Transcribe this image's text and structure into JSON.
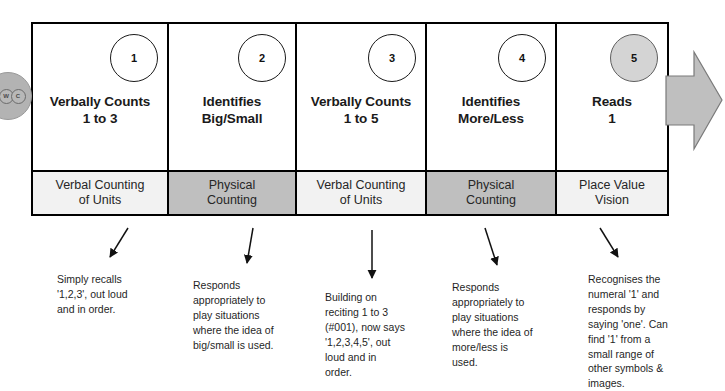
{
  "watermark": {
    "name": "watermark-badge",
    "letters": [
      "W",
      "C"
    ]
  },
  "progression_arrow": {
    "name": "progression-arrow",
    "color": "#bfbfbf"
  },
  "colors": {
    "light_strand": "#f2f2f2",
    "dark_strand": "#bfbfbf",
    "border": "#000000",
    "badge_active_fill": "#d4d4d4",
    "text": "#1a1a1a"
  },
  "steps": [
    {
      "number": "1",
      "badge_filled": false,
      "title": "Verbally Counts\n1 to 3",
      "strand": "Verbal Counting\nof Units",
      "strand_shade": "light",
      "note": "Simply recalls\n'1,2,3', out loud\nand in order."
    },
    {
      "number": "2",
      "badge_filled": false,
      "title": "Identifies\nBig/Small",
      "strand": "Physical\nCounting",
      "strand_shade": "dark",
      "note": "Responds\nappropriately to\nplay situations\nwhere the idea of\nbig/small is used."
    },
    {
      "number": "3",
      "badge_filled": false,
      "title": "Verbally Counts\n1 to 5",
      "strand": "Verbal Counting\nof Units",
      "strand_shade": "light",
      "note": "Building on\nreciting 1 to 3\n(#001), now says\n'1,2,3,4,5', out\nloud and in\norder."
    },
    {
      "number": "4",
      "badge_filled": false,
      "title": "Identifies\nMore/Less",
      "strand": "Physical\nCounting",
      "strand_shade": "dark",
      "note": "Responds\nappropriately to\nplay situations\nwhere the idea of\nmore/less is\nused."
    },
    {
      "number": "5",
      "badge_filled": true,
      "title": "Reads\n1",
      "strand": "Place Value\nVision",
      "strand_shade": "light",
      "note": "Recognises the\nnumeral '1' and\nresponds by\nsaying 'one'. Can\nfind '1' from a\nsmall range of\nother symbols &\nimages."
    }
  ]
}
